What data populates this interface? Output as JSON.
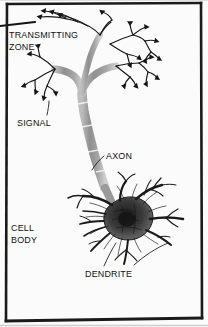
{
  "figure": {
    "style": "scanned textbook line drawing",
    "background_color": "#fbfbfb",
    "ink_color": "#111111",
    "axon_fill_color": "#9a9a9a",
    "soma_color": "#2b2b2b",
    "border_color": "#1a1a1a"
  },
  "labels": {
    "transmitting_zone": "TRANSMITTING\nZONE",
    "signal": "SIGNAL",
    "axon": "AXON",
    "cell_body": "CELL\nBODY",
    "dendrite": "DENDRITE"
  },
  "parts": [
    {
      "name": "transmitting-zone",
      "label": "TRANSMITTING ZONE",
      "description": "axon terminal arborization with synaptic boutons at top of figure"
    },
    {
      "name": "signal",
      "label": "SIGNAL",
      "description": "leader pointing to a terminal bouton on the left branch"
    },
    {
      "name": "axon",
      "label": "AXON",
      "description": "long tapered myelinated fiber with node constrictions"
    },
    {
      "name": "cell-body",
      "label": "CELL BODY",
      "description": "dark irregular soma at lower right"
    },
    {
      "name": "dendrite",
      "label": "DENDRITE",
      "description": "branching processes radiating from the soma"
    }
  ]
}
